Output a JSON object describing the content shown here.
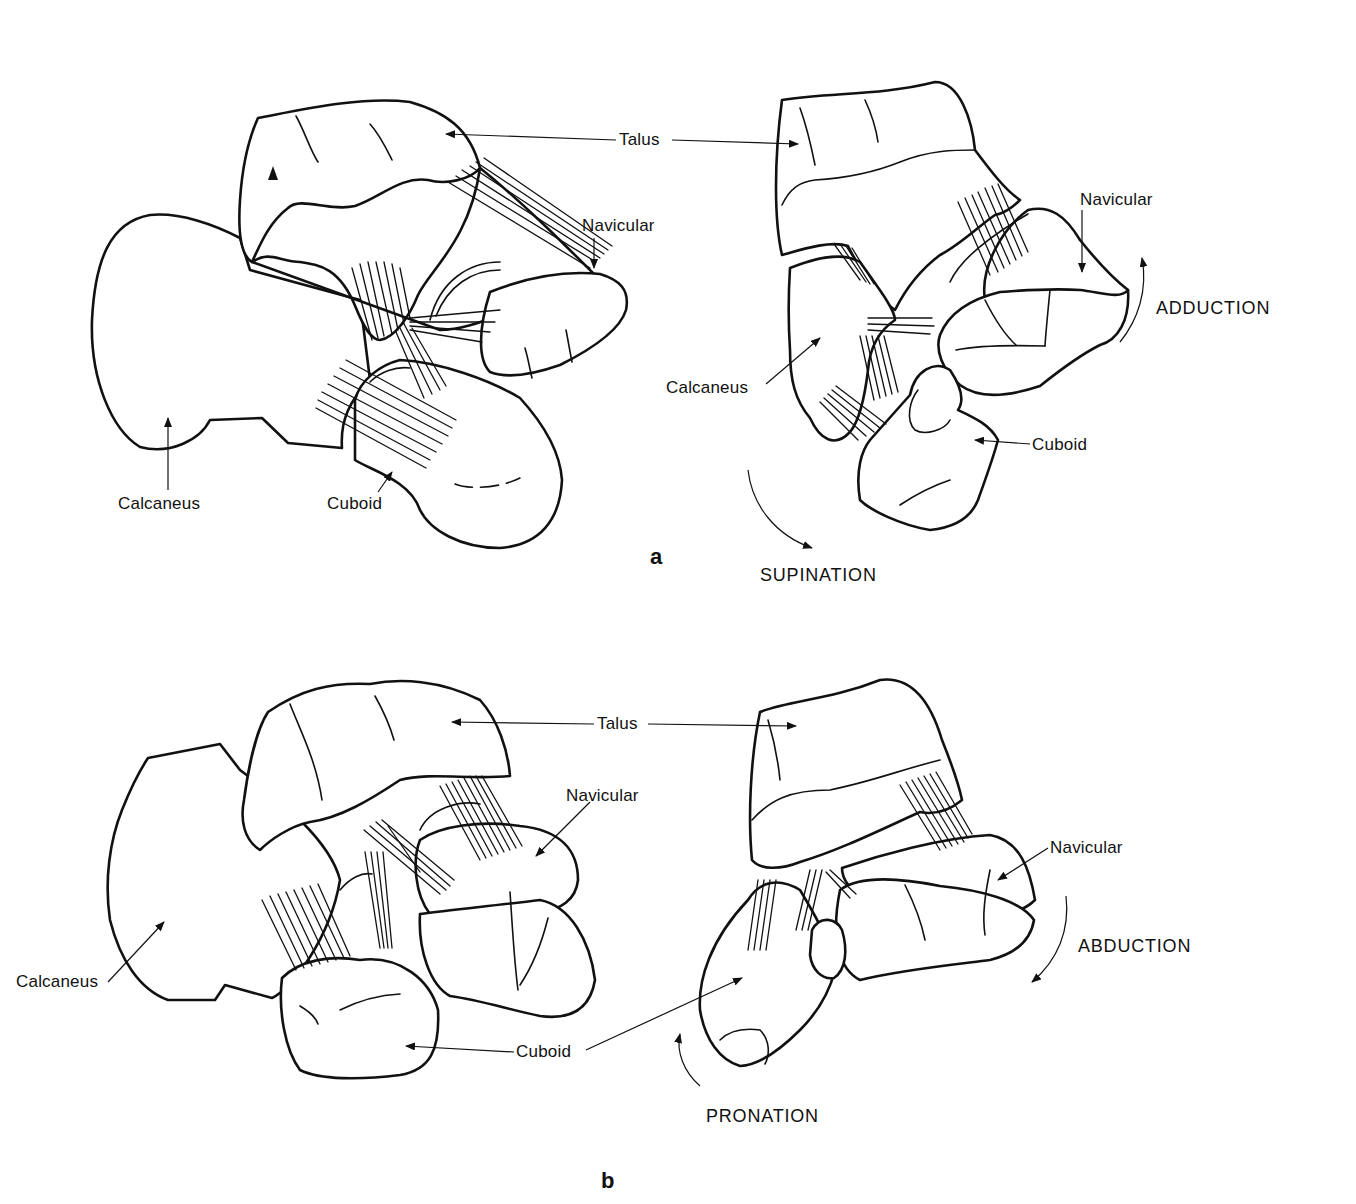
{
  "figure": {
    "panels": [
      {
        "id": "a",
        "label": "a",
        "left_view": {
          "labels": {
            "talus": "Talus",
            "navicular": "Navicular",
            "calcaneus": "Calcaneus",
            "cuboid": "Cuboid"
          }
        },
        "right_view": {
          "labels": {
            "navicular": "Navicular",
            "calcaneus": "Calcaneus",
            "cuboid": "Cuboid"
          },
          "motions": {
            "forefoot": "ADDUCTION",
            "rotation": "SUPINATION"
          }
        }
      },
      {
        "id": "b",
        "label": "b",
        "left_view": {
          "labels": {
            "talus": "Talus",
            "navicular": "Navicular",
            "calcaneus": "Calcaneus",
            "cuboid": "Cuboid"
          }
        },
        "right_view": {
          "labels": {
            "navicular": "Navicular"
          },
          "motions": {
            "forefoot": "ABDUCTION",
            "rotation": "PRONATION"
          }
        }
      }
    ],
    "line_color": "#111111",
    "background": "#ffffff"
  }
}
